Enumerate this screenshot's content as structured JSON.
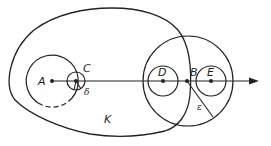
{
  "diagram": {
    "type": "geometric-figure",
    "stroke_color": "#222222",
    "background": "#ffffff",
    "labels": {
      "A": "A",
      "C": "C",
      "delta": "δ",
      "K": "K",
      "D": "D",
      "B": "B",
      "E": "E",
      "epsilon": "ε"
    },
    "points": [
      {
        "name": "A",
        "x": 52,
        "y": 81
      },
      {
        "name": "C",
        "x": 76,
        "y": 81
      },
      {
        "name": "D",
        "x": 163,
        "y": 81
      },
      {
        "name": "B",
        "x": 187,
        "y": 81
      },
      {
        "name": "E",
        "x": 211,
        "y": 81
      }
    ],
    "circles": [
      {
        "center": "A",
        "radius": 26,
        "note": "bottom arc partly dashed"
      },
      {
        "center": "C",
        "radius": 9,
        "radius_label": "δ"
      },
      {
        "center": "D",
        "radius": 15
      },
      {
        "center": "E",
        "radius": 15
      },
      {
        "center": "B",
        "radius": 45,
        "radius_label": "ε"
      }
    ],
    "region": {
      "name": "K",
      "shape": "closed curve"
    },
    "ray": {
      "from": "A",
      "direction": "right",
      "arrow": true
    }
  }
}
